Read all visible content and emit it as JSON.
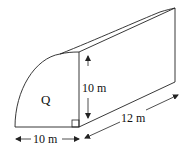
{
  "diagram": {
    "type": "quarter-cylinder prism",
    "face_label": "Q",
    "labels": {
      "height": "10 m",
      "base": "10 m",
      "length": "12 m"
    },
    "colors": {
      "line": "#222222",
      "background": "#ffffff"
    }
  }
}
